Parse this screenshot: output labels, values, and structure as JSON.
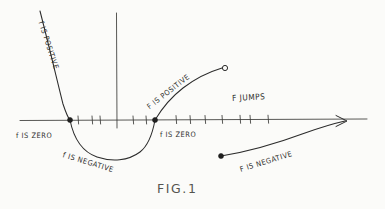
{
  "figure": {
    "caption": "FIG.1",
    "caption_position": {
      "x": 157,
      "y": 181
    },
    "background_color": "#fbfbf9",
    "ink_color": "#2b2b2b",
    "labels": [
      {
        "id": "left-branch-positive",
        "text": "f IS POSITIVE",
        "x": 41,
        "y": 17,
        "rotation_deg": 72
      },
      {
        "id": "left-root-zero",
        "text": "f IS ZERO",
        "x": 16,
        "y": 131,
        "rotation_deg": 0
      },
      {
        "id": "trough-negative",
        "text": "f IS NEGATIVE",
        "x": 63,
        "y": 150,
        "rotation_deg": 17
      },
      {
        "id": "right-root-zero",
        "text": "f IS ZERO",
        "x": 160,
        "y": 130,
        "rotation_deg": 0
      },
      {
        "id": "right-branch-positive",
        "text": "F IS POSITIVE",
        "x": 148,
        "y": 103,
        "rotation_deg": -38
      },
      {
        "id": "jump-note",
        "text": "F JUMPS",
        "x": 232,
        "y": 93,
        "rotation_deg": -3
      },
      {
        "id": "right-tail-negative",
        "text": "F IS NEGATIVE",
        "x": 240,
        "y": 165,
        "rotation_deg": -17
      }
    ],
    "markers": [
      {
        "id": "left-root-point",
        "type": "filled-dot",
        "x": 70,
        "y": 120,
        "r": 2.5
      },
      {
        "id": "right-root-point",
        "type": "filled-dot",
        "x": 155,
        "y": 120,
        "r": 2.5
      },
      {
        "id": "jump-open-endpoint",
        "type": "open-circle",
        "x": 225,
        "y": 68,
        "r": 2.6
      },
      {
        "id": "jump-resume-point",
        "type": "filled-dot",
        "x": 221,
        "y": 156,
        "r": 2.5
      }
    ],
    "axis": {
      "x_axis": {
        "x1": 20,
        "y1": 120,
        "x2": 367,
        "y2": 119
      },
      "y_axis": {
        "x1": 116,
        "y1": 13,
        "x2": 117,
        "y2": 128
      },
      "tick_positions_x": [
        78,
        92,
        100,
        133,
        146,
        176,
        190,
        205,
        222,
        240,
        250,
        268
      ],
      "tick_length": 7
    },
    "curves": [
      {
        "id": "parabola-left-branch",
        "path": "M40,11 C47,38 58,84 63,104 C66,113 68,118 70,120"
      },
      {
        "id": "parabola-trough",
        "path": "M70,120 C73,135 80,151 97,157 C112,162 128,161 140,152 C149,145 153,131 155,120"
      },
      {
        "id": "rising-branch",
        "path": "M155,120 C161,110 170,98 183,88 C196,78 212,71 222,68"
      },
      {
        "id": "right-negative-tail",
        "path": "M221,156 C246,152 278,143 305,133 C322,127 336,123 345,121"
      }
    ],
    "arrowheads": [
      {
        "id": "x-axis-arrow",
        "x": 345,
        "y": 121,
        "path": "M336,116 L346,121 L336,126"
      }
    ]
  }
}
